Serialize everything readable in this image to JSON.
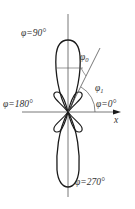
{
  "diagram": {
    "labels": {
      "phi_90": "φ=90°",
      "phi_180": "φ=180°",
      "phi_0": "φ=0°",
      "phi_270": "φ=270°",
      "phi0_symbol": "φ",
      "phi0_sub": "0",
      "phi1_symbol": "φ",
      "phi1_sub": "1",
      "x_axis": "x"
    },
    "colors": {
      "stroke": "#1a1a1a",
      "axis": "#555555",
      "text": "#333333",
      "background": "#ffffff"
    },
    "elements": {
      "main_lobes": [
        "upper (φ=90°)",
        "lower (φ=270°)"
      ],
      "side_lobes": 4,
      "angles": [
        "φ0 (between vertical axis and oblique line)",
        "φ1 (between x-axis and oblique line)"
      ]
    }
  }
}
